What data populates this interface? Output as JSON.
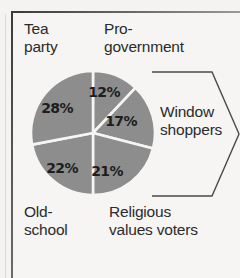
{
  "figure": {
    "name": "pie-chart-voter-segments",
    "background_color": "#f4f3f1",
    "frame_color": "#3a3a3a"
  },
  "chart_data": {
    "type": "pie",
    "title": "",
    "subtitle": "",
    "xlabel": "",
    "ylabel": "",
    "legend_position": "around-slices",
    "grid": false,
    "total": 100,
    "units": "%",
    "slice_color": "#8d8d8d",
    "separator_color": "#ffffff",
    "start_angle_deg": 0,
    "direction": "clockwise",
    "categories": [
      "Pro-government",
      "Window shoppers",
      "Religious values voters",
      "Old-school",
      "Tea party"
    ],
    "values": [
      12,
      17,
      21,
      22,
      28
    ],
    "labels": [
      "12%",
      "17%",
      "21%",
      "22%",
      "28%"
    ],
    "slices": [
      {
        "category": "Pro-government",
        "value": 12,
        "label": "12%",
        "label_x": 104,
        "label_y": 97,
        "callout": "Pro-\ngovernment",
        "callout_position": "top-right"
      },
      {
        "category": "Window shoppers",
        "value": 17,
        "label": "17%",
        "label_x": 121,
        "label_y": 126,
        "callout": "Window\nshoppers",
        "callout_position": "right",
        "bracketed": true
      },
      {
        "category": "Religious values voters",
        "value": 21,
        "label": "21%",
        "label_x": 107,
        "label_y": 176,
        "callout": "Religious\nvalues voters",
        "callout_position": "bottom-right"
      },
      {
        "category": "Old-school",
        "value": 22,
        "label": "22%",
        "label_x": 62,
        "label_y": 173,
        "callout": "Old-\nschool",
        "callout_position": "bottom-left"
      },
      {
        "category": "Tea party",
        "value": 28,
        "label": "28%",
        "label_x": 57,
        "label_y": 113,
        "callout": "Tea\nparty",
        "callout_position": "top-left"
      }
    ]
  },
  "callouts": {
    "tea_party": "Tea\nparty",
    "pro_government": "Pro-\ngovernment",
    "window_shoppers": "Window\nshoppers",
    "old_school": "Old-\nschool",
    "religious_values_voters": "Religious\nvalues voters"
  },
  "percent_labels": {
    "pro_government": "12%",
    "window_shoppers": "17%",
    "religious_values_voters": "21%",
    "old_school": "22%",
    "tea_party": "28%"
  }
}
